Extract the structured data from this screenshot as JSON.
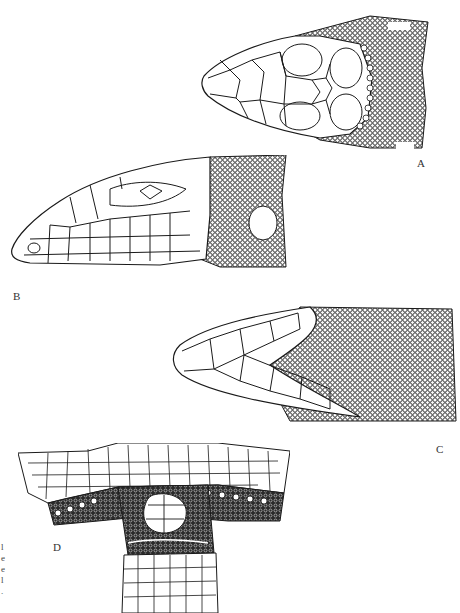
{
  "figure": {
    "panels": [
      {
        "id": "A",
        "label": "A",
        "view": "dorsal view of head"
      },
      {
        "id": "B",
        "label": "B",
        "view": "lateral view of head"
      },
      {
        "id": "C",
        "label": "C",
        "view": "ventral view of head"
      },
      {
        "id": "D",
        "label": "D",
        "view": "ventral view of vent / cloacal region"
      }
    ],
    "cropped_caption_fragments": [
      "l",
      "e",
      "e",
      "l",
      "."
    ],
    "colors": {
      "ink": "#1a1a1a",
      "paper": "#ffffff"
    }
  }
}
